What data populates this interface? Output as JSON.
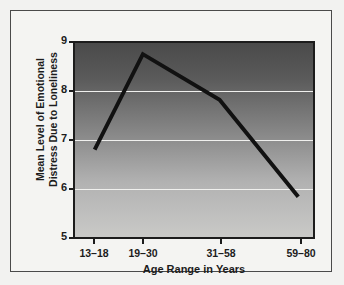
{
  "chart_data": {
    "type": "line",
    "title": "",
    "xlabel": "Age Range in Years",
    "ylabel_line1": "Mean Level of Emotional",
    "ylabel_line2": "Distress Due to Loneliness",
    "ylabel": "Mean Level of Emotional Distress Due to Loneliness",
    "categories": [
      "13–18",
      "19–30",
      "31–58",
      "59–80"
    ],
    "values": [
      6.8,
      8.77,
      7.83,
      5.83
    ],
    "ylim": [
      5,
      9
    ],
    "yticks": [
      9,
      8,
      7,
      6,
      5
    ],
    "gridlines": [
      8,
      7,
      6
    ],
    "grid": true,
    "legend": "none",
    "series": [
      {
        "name": "Mean distress",
        "values": [
          6.8,
          8.77,
          7.83,
          5.83
        ]
      }
    ],
    "colors": {
      "line": "#111111",
      "gridline": "#f0f0ee",
      "plot_bg_top": "#4a4a4a",
      "plot_bg_bottom": "#c9c9c7",
      "axis": "#1c1c1c",
      "frame_border": "#4a4a4a",
      "page_bg": "#f2f2f0"
    }
  }
}
